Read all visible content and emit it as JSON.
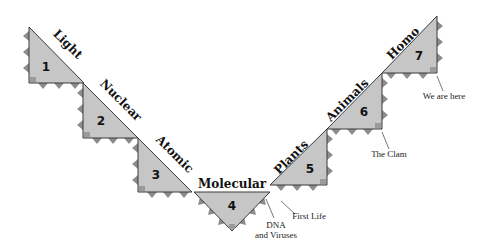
{
  "diagram": {
    "stages": [
      {
        "number": "1",
        "label": "Light"
      },
      {
        "number": "2",
        "label": "Nuclear"
      },
      {
        "number": "3",
        "label": "Atomic"
      },
      {
        "number": "4",
        "label": "Molecular"
      },
      {
        "number": "5",
        "label": "Plants"
      },
      {
        "number": "6",
        "label": "Animals"
      },
      {
        "number": "7",
        "label": "Homo"
      }
    ],
    "annotations": {
      "dna_line1": "DNA",
      "dna_line2": "and Viruses",
      "first_life": "First Life",
      "the_clam": "The Clam",
      "we_are_here": "We are here"
    },
    "colors": {
      "fill": "#c6c6c6",
      "sawtooth": "#8c8c8c",
      "outline": "#3a3a3a"
    }
  }
}
